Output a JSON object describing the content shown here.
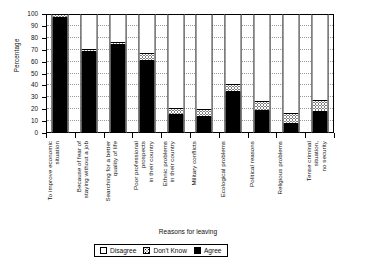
{
  "chart_data": {
    "type": "bar",
    "subtype": "stacked-bar-100",
    "title": "",
    "xlabel": "Reasons for leaving",
    "ylabel": "Percentage",
    "ylim": [
      0,
      100
    ],
    "yticks": [
      0,
      10,
      20,
      30,
      40,
      50,
      60,
      70,
      80,
      90,
      100
    ],
    "ytick_labels": [
      "0",
      "10",
      "20",
      "30",
      "40",
      "50",
      "60",
      "70",
      "80",
      "90",
      "100"
    ],
    "grid": true,
    "grid_axis": "y",
    "legend_position": "bottom",
    "categories": [
      "To improve economic\nsituation",
      "Because of fear of\nstaying without a job",
      "Searching for a better\nquality of life",
      "Poor professional\nprospects\nin their country",
      "Ethnic problems\nin their country",
      "Military conflicts",
      "Ecological problems",
      "Political reasons",
      "Religious problems",
      "Tense criminal\nsituation,\nno security"
    ],
    "series": [
      {
        "name": "Agree",
        "color": "#000000",
        "values": [
          96,
          67,
          73,
          60,
          14,
          13,
          34,
          18,
          7,
          17
        ]
      },
      {
        "name": "Don't Know",
        "color": "#ffffff",
        "pattern": "dotted",
        "values": [
          3,
          3,
          3,
          6,
          6,
          6,
          6,
          8,
          9,
          10
        ]
      },
      {
        "name": "Disagree",
        "color": "#ffffff",
        "values": [
          1,
          30,
          24,
          34,
          80,
          81,
          60,
          74,
          84,
          73
        ]
      }
    ]
  },
  "legend": {
    "items": [
      {
        "label": "Disagree",
        "swatch": "disagree-swatch"
      },
      {
        "label": "Don't Know",
        "swatch": "dont-know-swatch"
      },
      {
        "label": "Agree",
        "swatch": "agree-swatch"
      }
    ]
  }
}
